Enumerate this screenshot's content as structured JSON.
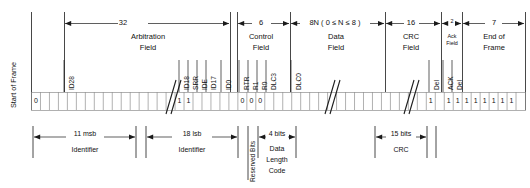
{
  "frame": {
    "start_of_frame_label": "Start of Frame",
    "fields": [
      {
        "name": "arbitration-field",
        "bits_label": "32",
        "line1": "Arbitration",
        "line2": "Field",
        "small": false
      },
      {
        "name": "control-field",
        "bits_label": "6",
        "line1": "Control",
        "line2": "Field",
        "small": false
      },
      {
        "name": "data-field",
        "bits_label": "8N ( 0 ≤ N ≤ 8 )",
        "line1": "Data",
        "line2": "Field",
        "small": false
      },
      {
        "name": "crc-field",
        "bits_label": "16",
        "line1": "CRC",
        "line2": "Field",
        "small": false
      },
      {
        "name": "ack-field",
        "bits_label": "2",
        "line1": "Ack",
        "line2": "Field",
        "small": true
      },
      {
        "name": "end-of-frame",
        "bits_label": "7",
        "line1": "End of",
        "line2": "Frame",
        "small": false
      }
    ],
    "bit_markers": [
      {
        "name": "id28",
        "label": "ID28"
      },
      {
        "name": "id18",
        "label": "ID18"
      },
      {
        "name": "srr",
        "label": "SRR"
      },
      {
        "name": "ide",
        "label": "IDE"
      },
      {
        "name": "id17",
        "label": "ID17"
      },
      {
        "name": "id0",
        "label": "ID0"
      },
      {
        "name": "rtr",
        "label": "RTR"
      },
      {
        "name": "r1",
        "label": "R1"
      },
      {
        "name": "r0",
        "label": "R0"
      },
      {
        "name": "dlc3",
        "label": "DLC3"
      },
      {
        "name": "dlc0",
        "label": "DLC0"
      },
      {
        "name": "crc-delimiter",
        "label": "Del"
      },
      {
        "name": "ack-slot",
        "label": "ACK"
      },
      {
        "name": "ack-delimiter",
        "label": "Del"
      }
    ],
    "bit_values": [
      {
        "name": "sof-bit",
        "value": "0"
      },
      {
        "name": "srr-bit",
        "value": "1"
      },
      {
        "name": "ide-bit",
        "value": "1"
      },
      {
        "name": "rtr-bit",
        "value": "0"
      },
      {
        "name": "r1-bit",
        "value": "0"
      },
      {
        "name": "r0-bit",
        "value": "0"
      },
      {
        "name": "crc-del-bit",
        "value": "1"
      },
      {
        "name": "ack-del-bit",
        "value": "1"
      },
      {
        "name": "eof-bit-1",
        "value": "1"
      },
      {
        "name": "eof-bit-2",
        "value": "1"
      },
      {
        "name": "eof-bit-3",
        "value": "1"
      },
      {
        "name": "eof-bit-4",
        "value": "1"
      },
      {
        "name": "eof-bit-5",
        "value": "1"
      },
      {
        "name": "eof-bit-6",
        "value": "1"
      },
      {
        "name": "eof-bit-7",
        "value": "1"
      }
    ],
    "bottom_annotations": [
      {
        "name": "identifier-msb",
        "bits": "11 msb",
        "caption": "Identifier",
        "lines": [
          "Identifier"
        ]
      },
      {
        "name": "identifier-lsb",
        "bits": "18 lsb",
        "caption": "Identifier",
        "lines": [
          "Identifier"
        ]
      },
      {
        "name": "reserved-bits",
        "bits": "",
        "caption": "Reserved Bits",
        "lines": [
          "Reserved Bits"
        ],
        "vertical": true
      },
      {
        "name": "data-length-code",
        "bits": "4 bits",
        "caption": "Data Length Code",
        "lines": [
          "Data",
          "Length",
          "Code"
        ]
      },
      {
        "name": "crc",
        "bits": "15 bits",
        "caption": "CRC",
        "lines": [
          "CRC"
        ]
      }
    ]
  },
  "colors": {
    "line": "#1a1a1a",
    "grid": "#9a9a9a",
    "background": "#ffffff"
  }
}
